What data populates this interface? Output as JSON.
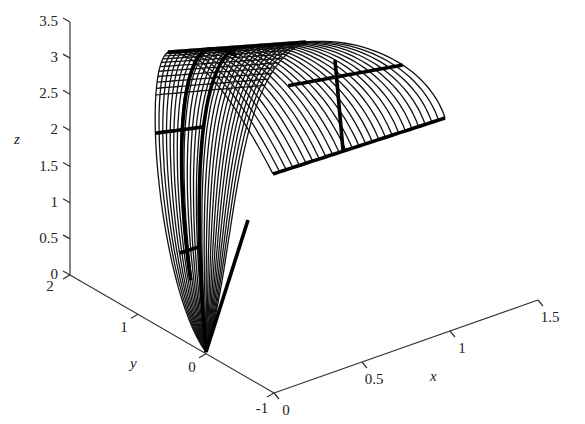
{
  "chart_data": {
    "type": "surface3d",
    "title": "",
    "xlabel": "x",
    "ylabel": "y",
    "zlabel": "z",
    "x_ticks": [
      "0",
      "0.5",
      "1",
      "1.5"
    ],
    "y_ticks": [
      "-1",
      "0",
      "1",
      "2"
    ],
    "z_ticks": [
      "0",
      "0.5",
      "1",
      "1.5",
      "2",
      "2.5",
      "3",
      "3.5"
    ],
    "xlim": [
      0,
      1.5
    ],
    "ylim": [
      -1,
      2
    ],
    "zlim": [
      0,
      3.5
    ],
    "grid": false,
    "legend": null,
    "style": "black wireframe mesh with highlighted thick parameter curves",
    "surface_description": "Surface rises from the point (x=0, y=0, z=0) up along a wall to a ridge near z≈3, then slopes outward along x toward x≈1.5; several thick curves mark selected parameter lines on the mesh"
  },
  "axes": {
    "x": {
      "label": "x",
      "ticks": [
        "0",
        "0.5",
        "1",
        "1.5"
      ]
    },
    "y": {
      "label": "y",
      "ticks": [
        "-1",
        "0",
        "1",
        "2"
      ]
    },
    "z": {
      "label": "z",
      "ticks": [
        "0",
        "0.5",
        "1",
        "1.5",
        "2",
        "2.5",
        "3",
        "3.5"
      ]
    }
  }
}
